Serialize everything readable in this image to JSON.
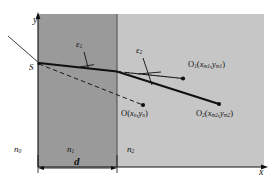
{
  "figure": {
    "type": "optics-ray-diagram"
  },
  "axes": {
    "y_label": "y",
    "x_label": "x"
  },
  "media": {
    "n0": "n",
    "n0_sub": "0",
    "n1": "n",
    "n1_sub": "1",
    "n2": "n",
    "n2_sub": "2"
  },
  "dimension": {
    "thickness_label": "d"
  },
  "source": {
    "label": "S"
  },
  "angles": [
    {
      "symbol": "ε",
      "sub": "1",
      "name": "angle-epsilon-1"
    },
    {
      "symbol": "ε",
      "sub": "2",
      "name": "angle-epsilon-2"
    }
  ],
  "points": [
    {
      "name": "point-O",
      "label": "O",
      "coords_open": "(",
      "x_sym": "x",
      "x_sub": "n",
      "sep": ",",
      "y_sym": "y",
      "y_sub": "n",
      "coords_close": ")"
    },
    {
      "name": "point-O1",
      "label": "O",
      "label_sub": "1",
      "coords_open": "(",
      "x_sym": "x",
      "x_sub": "m1",
      "sep": ",",
      "y_sym": "y",
      "y_sub": "m1",
      "coords_close": ")"
    },
    {
      "name": "point-O2",
      "label": "O",
      "label_sub": "2",
      "coords_open": "(",
      "x_sym": "x",
      "x_sub": "m2",
      "sep": ",",
      "y_sym": "y",
      "y_sub": "m2",
      "coords_close": ")"
    }
  ],
  "colors": {
    "region_n0": "#ffffff",
    "region_n1": "#9a9a9a",
    "region_n2": "#c6c6c6",
    "stroke": "#101010",
    "thin_stroke": "#2a2a2a"
  }
}
